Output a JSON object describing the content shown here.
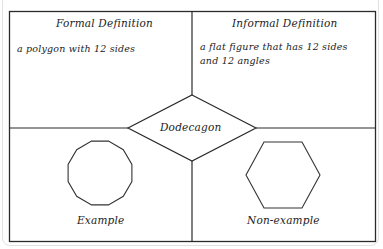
{
  "diagram": {
    "type": "frayer-model",
    "center_term": "Dodecagon",
    "quadrants": {
      "top_left": {
        "title": "Formal Definition",
        "text": "a polygon with 12 sides"
      },
      "top_right": {
        "title": "Informal Definition",
        "text": "a flat figure that has 12 sides and 12 angles"
      },
      "bottom_left": {
        "title": "Example",
        "shape": "dodecagon (12-sided regular polygon)"
      },
      "bottom_right": {
        "title": "Non-example",
        "shape": "hexagon (6-sided regular polygon)"
      }
    },
    "colors": {
      "line": "#2b2b2b",
      "text": "#222222",
      "background": "#ffffff"
    }
  }
}
